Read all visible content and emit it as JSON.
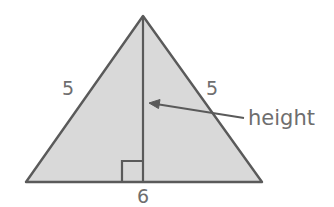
{
  "figure": {
    "type": "geometry-diagram",
    "shape": "isosceles-triangle",
    "background_color": "#ffffff",
    "fill_color": "#d9d9d9",
    "stroke_color": "#5a5a5a",
    "text_color": "#6e6e6e",
    "labels": {
      "left_side": "5",
      "right_side": "5",
      "base": "6",
      "height_callout": "height"
    },
    "geometry": {
      "apex": [
        143,
        16
      ],
      "bottom_left": [
        26,
        182
      ],
      "bottom_right": [
        262,
        182
      ],
      "height_foot": [
        143,
        182
      ],
      "right_angle_marker": [
        122,
        161,
        21,
        21
      ],
      "arrow_from": [
        244,
        118
      ],
      "arrow_to": [
        150,
        103
      ]
    }
  }
}
